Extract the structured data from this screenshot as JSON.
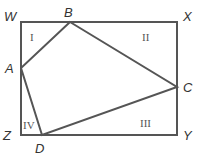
{
  "diagram": {
    "stroke_color": "#555555",
    "rectangle": {
      "corners": [
        "W",
        "X",
        "Y",
        "Z"
      ]
    },
    "quadrilateral": {
      "vertices": [
        "A",
        "B",
        "C",
        "D"
      ]
    },
    "points": {
      "W": "W",
      "X": "X",
      "Y": "Y",
      "Z": "Z",
      "A": "A",
      "B": "B",
      "C": "C",
      "D": "D"
    },
    "regions": {
      "I": "I",
      "II": "II",
      "III": "III",
      "IV": "IV"
    }
  }
}
